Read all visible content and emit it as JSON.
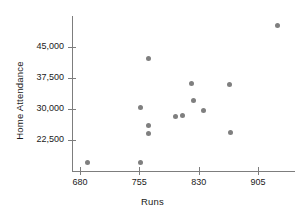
{
  "chart_data": {
    "type": "scatter",
    "title": "",
    "xlabel": "Runs",
    "ylabel": "Home Attendance",
    "xlim": [
      665,
      945
    ],
    "ylim": [
      14500,
      52000
    ],
    "xticks": [
      680,
      755,
      830,
      905
    ],
    "xtick_labels": [
      "680",
      "755",
      "830",
      "905"
    ],
    "yticks": [
      22500,
      30000,
      37500,
      45000
    ],
    "ytick_labels": [
      "22,500",
      "30,000",
      "37,500",
      "45,000"
    ],
    "grid": false,
    "legend": null,
    "marker_color": "#7f7f7f",
    "axis_color": "#7d7d7d",
    "points": [
      {
        "x": 690,
        "y": 17100
      },
      {
        "x": 756,
        "y": 17100
      },
      {
        "x": 767,
        "y": 42200
      },
      {
        "x": 757,
        "y": 30350
      },
      {
        "x": 767,
        "y": 26000
      },
      {
        "x": 767,
        "y": 24100
      },
      {
        "x": 801,
        "y": 28200
      },
      {
        "x": 810,
        "y": 28400
      },
      {
        "x": 821,
        "y": 36200
      },
      {
        "x": 823,
        "y": 32000
      },
      {
        "x": 836,
        "y": 29700
      },
      {
        "x": 869,
        "y": 36000
      },
      {
        "x": 870,
        "y": 24400
      },
      {
        "x": 930,
        "y": 50200
      }
    ]
  },
  "axis": {
    "x_title": "Runs",
    "y_title": "Home Attendance"
  }
}
